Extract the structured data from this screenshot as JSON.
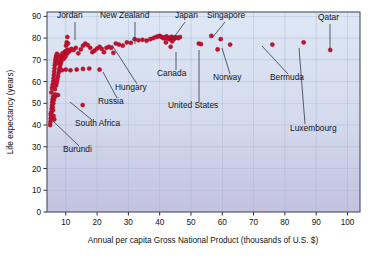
{
  "chart_data": {
    "type": "scatter",
    "title": "",
    "xlabel": "Annual per capita Gross National Product (thousands of U.S. $)",
    "ylabel": "Life expectancy (years)",
    "xlim": [
      4,
      104
    ],
    "ylim": [
      0,
      92
    ],
    "xticks": [
      10,
      20,
      30,
      40,
      50,
      60,
      70,
      80,
      90,
      100
    ],
    "yticks": [
      0,
      10,
      20,
      30,
      40,
      50,
      60,
      70,
      80,
      90
    ],
    "grid": true,
    "legend": "none",
    "point_color": "#c8102e",
    "plot_background_top": "#dde6f4",
    "plot_background_bottom": "#c3c3de",
    "points": [
      [
        5.0,
        40.0
      ],
      [
        5.1,
        41.5
      ],
      [
        5.2,
        43.0
      ],
      [
        5.3,
        44.5
      ],
      [
        5.4,
        46.0
      ],
      [
        5.5,
        47.5
      ],
      [
        5.6,
        49.0
      ],
      [
        5.7,
        50.5
      ],
      [
        5.8,
        51.8
      ],
      [
        5.9,
        53.0
      ],
      [
        5.4,
        55.0
      ],
      [
        5.6,
        57.0
      ],
      [
        5.8,
        58.5
      ],
      [
        6.0,
        60.0
      ],
      [
        6.1,
        61.5
      ],
      [
        6.2,
        63.0
      ],
      [
        6.3,
        64.5
      ],
      [
        6.4,
        66.0
      ],
      [
        6.5,
        67.5
      ],
      [
        6.6,
        68.5
      ],
      [
        6.7,
        69.5
      ],
      [
        6.8,
        70.5
      ],
      [
        6.9,
        71.2
      ],
      [
        7.0,
        72.0
      ],
      [
        7.2,
        72.8
      ],
      [
        5.2,
        45.2
      ],
      [
        5.5,
        43.8
      ],
      [
        5.8,
        48.2
      ],
      [
        6.0,
        50.0
      ],
      [
        6.2,
        51.5
      ],
      [
        6.4,
        52.8
      ],
      [
        6.6,
        54.0
      ],
      [
        5.9,
        46.8
      ],
      [
        6.1,
        44.2
      ],
      [
        6.3,
        42.6
      ],
      [
        6.8,
        53.8
      ],
      [
        7.5,
        53.8
      ],
      [
        6.5,
        56.5
      ],
      [
        6.9,
        58.2
      ],
      [
        7.1,
        59.5
      ],
      [
        7.3,
        61.0
      ],
      [
        7.5,
        62.5
      ],
      [
        7.7,
        64.0
      ],
      [
        7.9,
        65.2
      ],
      [
        8.1,
        66.5
      ],
      [
        8.3,
        67.8
      ],
      [
        8.5,
        69.0
      ],
      [
        8.7,
        70.0
      ],
      [
        8.9,
        71.0
      ],
      [
        9.1,
        71.8
      ],
      [
        9.3,
        72.5
      ],
      [
        9.5,
        73.2
      ],
      [
        9.8,
        73.8
      ],
      [
        10.2,
        74.2
      ],
      [
        10.6,
        74.6
      ],
      [
        7.4,
        68.5
      ],
      [
        7.8,
        69.8
      ],
      [
        8.2,
        71.5
      ],
      [
        8.6,
        72.2
      ],
      [
        9.0,
        73.0
      ],
      [
        9.4,
        70.5
      ],
      [
        9.9,
        71.5
      ],
      [
        10.4,
        72.8
      ],
      [
        10.8,
        73.5
      ],
      [
        11.2,
        74.0
      ],
      [
        8.0,
        65.5
      ],
      [
        8.8,
        65.2
      ],
      [
        10.0,
        65.5
      ],
      [
        11.5,
        65.2
      ],
      [
        13.5,
        65.5
      ],
      [
        15.5,
        65.8
      ],
      [
        17.5,
        66.0
      ],
      [
        20.8,
        65.5
      ],
      [
        10.5,
        80.5
      ],
      [
        10.3,
        78.0
      ],
      [
        10.1,
        76.5
      ],
      [
        10.7,
        77.5
      ],
      [
        11.8,
        75.0
      ],
      [
        12.5,
        74.5
      ],
      [
        13.2,
        75.5
      ],
      [
        14.0,
        73.0
      ],
      [
        14.8,
        74.8
      ],
      [
        15.5,
        76.5
      ],
      [
        16.2,
        77.5
      ],
      [
        17.0,
        76.8
      ],
      [
        17.8,
        75.5
      ],
      [
        18.5,
        73.5
      ],
      [
        19.2,
        74.2
      ],
      [
        20.0,
        75.2
      ],
      [
        20.8,
        76.0
      ],
      [
        21.5,
        75.0
      ],
      [
        22.2,
        73.5
      ],
      [
        23.0,
        75.5
      ],
      [
        23.8,
        76.0
      ],
      [
        24.5,
        75.5
      ],
      [
        25.2,
        73.2
      ],
      [
        26.0,
        77.5
      ],
      [
        27.0,
        77.0
      ],
      [
        28.2,
        76.5
      ],
      [
        29.5,
        78.0
      ],
      [
        30.8,
        77.8
      ],
      [
        32.0,
        79.5
      ],
      [
        33.2,
        79.0
      ],
      [
        34.5,
        79.2
      ],
      [
        35.8,
        78.8
      ],
      [
        15.4,
        49.2
      ],
      [
        37.0,
        79.5
      ],
      [
        38.0,
        80.0
      ],
      [
        38.8,
        80.5
      ],
      [
        39.5,
        80.8
      ],
      [
        40.0,
        81.0
      ],
      [
        40.5,
        80.6
      ],
      [
        41.0,
        80.2
      ],
      [
        41.4,
        79.8
      ],
      [
        41.8,
        80.4
      ],
      [
        42.2,
        80.8
      ],
      [
        42.6,
        80.0
      ],
      [
        43.0,
        79.5
      ],
      [
        43.4,
        80.2
      ],
      [
        43.8,
        80.6
      ],
      [
        44.2,
        80.0
      ],
      [
        44.6,
        79.6
      ],
      [
        45.0,
        80.4
      ],
      [
        45.5,
        80.2
      ],
      [
        46.0,
        80.0
      ],
      [
        46.5,
        80.5
      ],
      [
        43.5,
        76.0
      ],
      [
        44.0,
        78.5
      ],
      [
        42.0,
        78.0
      ],
      [
        52.5,
        77.5
      ],
      [
        53.2,
        77.2
      ],
      [
        56.5,
        81.0
      ],
      [
        59.5,
        79.5
      ],
      [
        58.5,
        74.8
      ],
      [
        62.5,
        77.0
      ],
      [
        76.0,
        77.0
      ],
      [
        86.0,
        78.0
      ],
      [
        94.5,
        74.5
      ]
    ],
    "annotations": [
      {
        "label": "Jordan",
        "label_x": 57,
        "label_y": 18,
        "line": [
          [
            75,
            22
          ],
          [
            75,
            40
          ]
        ]
      },
      {
        "label": "New Zealand",
        "label_x": 100,
        "label_y": 18,
        "line": [
          [
            135,
            22
          ],
          [
            135,
            44
          ]
        ]
      },
      {
        "label": "Japan",
        "label_x": 175,
        "label_y": 18,
        "line": [
          [
            185,
            22
          ],
          [
            172,
            40
          ]
        ]
      },
      {
        "label": "Singapore",
        "label_x": 207,
        "label_y": 18,
        "line": [
          [
            225,
            22
          ],
          [
            212,
            38
          ]
        ]
      },
      {
        "label": "Qatar",
        "label_x": 318,
        "label_y": 20,
        "line": [
          [
            330,
            24
          ],
          [
            330,
            50
          ]
        ]
      },
      {
        "label": "Canada",
        "label_x": 157,
        "label_y": 76,
        "line": [
          [
            176,
            70
          ],
          [
            176,
            52
          ]
        ]
      },
      {
        "label": "Norway",
        "label_x": 213,
        "label_y": 80,
        "line": [
          [
            230,
            74
          ],
          [
            222,
            48
          ]
        ]
      },
      {
        "label": "Bermuda",
        "label_x": 270,
        "label_y": 80,
        "line": [
          [
            288,
            74
          ],
          [
            262,
            46
          ]
        ]
      },
      {
        "label": "Hungary",
        "label_x": 115,
        "label_y": 90,
        "line": [
          [
            137,
            84
          ],
          [
            112,
            45
          ]
        ]
      },
      {
        "label": "Russia",
        "label_x": 98,
        "label_y": 104,
        "line": [
          [
            117,
            98
          ],
          [
            103,
            72
          ]
        ]
      },
      {
        "label": "United States",
        "label_x": 168,
        "label_y": 108,
        "line": [
          [
            199,
            102
          ],
          [
            199,
            50
          ]
        ]
      },
      {
        "label": "Luxembourg",
        "label_x": 290,
        "label_y": 131,
        "line": [
          [
            305,
            124
          ],
          [
            299,
            48
          ]
        ]
      },
      {
        "label": "South Africa",
        "label_x": 75,
        "label_y": 126,
        "line": [
          [
            92,
            120
          ],
          [
            70,
            102
          ]
        ]
      },
      {
        "label": "Burundi",
        "label_x": 63,
        "label_y": 152,
        "line": [
          [
            79,
            146
          ],
          [
            53,
            121
          ]
        ]
      }
    ]
  }
}
